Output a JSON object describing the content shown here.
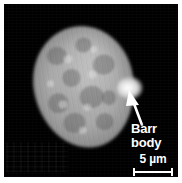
{
  "figure": {
    "type": "fluorescence-micrograph",
    "border_color": "#ffffff",
    "field_color": "#000000"
  },
  "annotations": {
    "barr_body": {
      "label_line1": "Barr",
      "label_line2": "body",
      "label_color": "#ffffff",
      "pointer": "arrow-up-left",
      "target": "bright spot on right edge of nucleus"
    }
  },
  "scale_bar": {
    "value": "5",
    "unit": "µm",
    "text": "5 µm",
    "color": "#ffffff",
    "length_px": 40
  },
  "specimen": {
    "nucleus_label": "nucleus",
    "stain_appearance": "mottled grey chromatin",
    "barr_body_appearance": "bright condensed spot"
  }
}
